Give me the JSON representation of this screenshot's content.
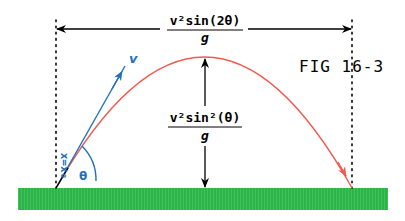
{
  "figure": {
    "label": "FIG 16-3",
    "range_formula": {
      "numerator": "v²sin(2θ)",
      "denominator": "g"
    },
    "height_formula": {
      "numerator": "v²sin²(θ)",
      "denominator": "g"
    },
    "velocity_label": "v",
    "angle_label": "θ",
    "position_label": "x=x₀"
  },
  "colors": {
    "trajectory": "#f05a4f",
    "velocity": "#1f6fc0",
    "ground": "#2db34a",
    "annotation": "#000000"
  }
}
